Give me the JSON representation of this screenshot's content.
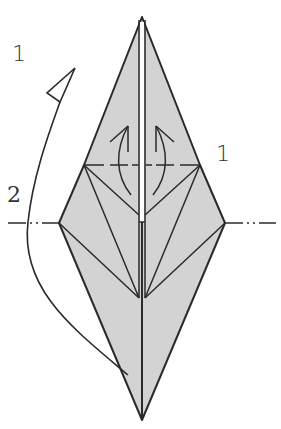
{
  "figure": {
    "type": "origami-fold-diagram",
    "labels": {
      "step1_left": "1",
      "step1_right": "1",
      "step2": "2"
    },
    "colors": {
      "paper": "#d3d3d3",
      "line": "#2a2a2a",
      "center_gap": "#ffffff",
      "background": "#ffffff"
    },
    "annotations": [
      {
        "id": "step1",
        "description": "Valley-fold the upper flaps along horizontal dashed line, swinging them upward"
      },
      {
        "id": "step2",
        "description": "Mountain-fold along the horizontal dash-dot line, folding the bottom behind"
      }
    ]
  }
}
